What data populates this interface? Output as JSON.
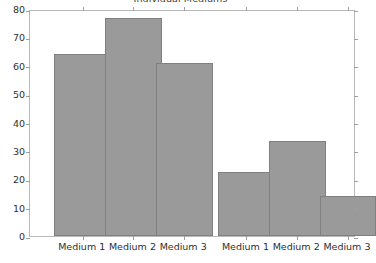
{
  "chart_data": {
    "type": "bar",
    "title": "Individual Mediums",
    "xlabel": "",
    "ylabel": "",
    "ylim": [
      0,
      80
    ],
    "yticks": [
      0,
      10,
      20,
      30,
      40,
      50,
      60,
      70,
      80
    ],
    "grid": false,
    "legend": null,
    "bar_color": "#9a9a9a",
    "bar_border_color": "#808080",
    "background": "#ffffff",
    "frame_color": "#b9b9b9",
    "categories": [
      "Medium 1",
      "Medium 2",
      "Medium 3",
      "Medium 1",
      "Medium 2",
      "Medium 3"
    ],
    "values": [
      64,
      77,
      61,
      22.5,
      33.5,
      14
    ],
    "groups": [
      {
        "name": "group-left",
        "categories": [
          "Medium 1",
          "Medium 2",
          "Medium 3"
        ],
        "values": [
          64,
          77,
          61
        ]
      },
      {
        "name": "group-right",
        "categories": [
          "Medium 1",
          "Medium 2",
          "Medium 3"
        ],
        "values": [
          22.5,
          33.5,
          14
        ]
      }
    ],
    "bars": [
      {
        "label": "Medium 1",
        "value": 64,
        "x_center_pct": 13.8,
        "width_pct": 17.5
      },
      {
        "label": "Medium 2",
        "value": 77,
        "x_center_pct": 31.9,
        "width_pct": 17.5
      },
      {
        "label": "Medium 3",
        "value": 61,
        "x_center_pct": 50.0,
        "width_pct": 17.5
      },
      {
        "label": "Medium 1",
        "value": 22.5,
        "x_center_pct": 72.2,
        "width_pct": 17.5
      },
      {
        "label": "Medium 2",
        "value": 33.5,
        "x_center_pct": 90.3,
        "width_pct": 17.5
      },
      {
        "label": "Medium 3",
        "value": 14,
        "x_center_pct": 108.4,
        "width_pct": 17.5
      }
    ]
  }
}
